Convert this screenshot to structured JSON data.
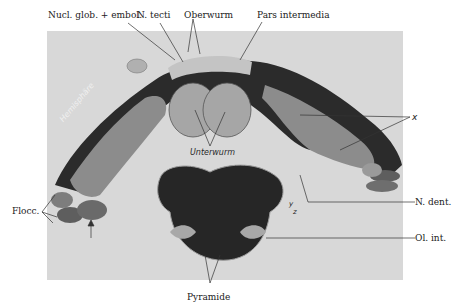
{
  "figure": {
    "labels": {
      "nucl_glob_embol": "Nucl. glob. + embol.",
      "n_tecti": "N. tecti",
      "oberwurm": "Oberwurm",
      "pars_intermedia": "Pars intermedia",
      "hemisphaere": "Hemisphäre",
      "unterwurm": "Unterwurm",
      "flocc": "Flocc.",
      "x": "x",
      "n_dent": "N. dent.",
      "ol_int": "Ol. int.",
      "pyramide": "Pyramide",
      "y": "y",
      "z": "z"
    },
    "colors": {
      "background": "#ffffff",
      "plate": "#d9d9d9",
      "tissue_dark": "#2a2a2a",
      "tissue_mid": "#8a8a8a",
      "tissue_light": "#b9b9b9",
      "leader_line": "#333333"
    }
  }
}
